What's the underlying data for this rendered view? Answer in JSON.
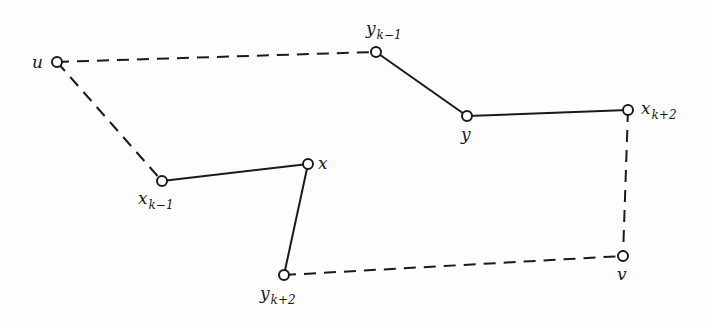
{
  "diagram": {
    "type": "graph-path-exchange",
    "nodes": [
      {
        "id": "u",
        "label": "u",
        "sub": "",
        "x": 57,
        "y": 62,
        "lx": 32,
        "ly": 68
      },
      {
        "id": "y_k-1",
        "label": "y",
        "sub": "k−1",
        "x": 376,
        "y": 52,
        "lx": 366,
        "ly": 34
      },
      {
        "id": "y",
        "label": "y",
        "sub": "",
        "x": 467,
        "y": 116,
        "lx": 461,
        "ly": 140
      },
      {
        "id": "x_k+2",
        "label": "x",
        "sub": "k+2",
        "x": 628,
        "y": 110,
        "lx": 641,
        "ly": 114
      },
      {
        "id": "x_k-1",
        "label": "x",
        "sub": "k−1",
        "x": 162,
        "y": 181,
        "lx": 138,
        "ly": 204
      },
      {
        "id": "x",
        "label": "x",
        "sub": "",
        "x": 308,
        "y": 164,
        "lx": 318,
        "ly": 169
      },
      {
        "id": "y_k+2",
        "label": "y",
        "sub": "k+2",
        "x": 284,
        "y": 275,
        "lx": 260,
        "ly": 299
      },
      {
        "id": "v",
        "label": "v",
        "sub": "",
        "x": 623,
        "y": 256,
        "lx": 617,
        "ly": 280
      }
    ],
    "edges": [
      {
        "from": "u",
        "to": "y_k-1",
        "style": "dashed"
      },
      {
        "from": "u",
        "to": "x_k-1",
        "style": "dashed"
      },
      {
        "from": "y_k-1",
        "to": "y",
        "style": "solid"
      },
      {
        "from": "y",
        "to": "x_k+2",
        "style": "solid"
      },
      {
        "from": "x_k+2",
        "to": "v",
        "style": "dashed"
      },
      {
        "from": "x_k-1",
        "to": "x",
        "style": "solid"
      },
      {
        "from": "x",
        "to": "y_k+2",
        "style": "solid"
      },
      {
        "from": "y_k+2",
        "to": "v",
        "style": "dashed"
      }
    ],
    "colors": {
      "stroke": "#1a1a1a",
      "node_fill": "#ffffff",
      "background": "#fdfdfd"
    }
  }
}
